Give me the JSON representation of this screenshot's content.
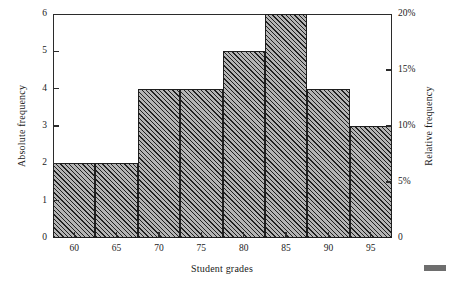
{
  "chart_data": {
    "type": "bar",
    "title": "",
    "subtitle": "",
    "xlabel": "Student grades",
    "ylabel": "Absolute frequency",
    "y2label": "Relative frequency",
    "grid": false,
    "legend": null,
    "xlim": [
      57.5,
      97.5
    ],
    "ylim": [
      0,
      6
    ],
    "y2lim": [
      0,
      20
    ],
    "bin_width": 5,
    "bin_edges": [
      57.5,
      62.5,
      67.5,
      72.5,
      77.5,
      82.5,
      87.5,
      92.5,
      97.5
    ],
    "categories": [
      "57.5-62.5",
      "62.5-67.5",
      "67.5-72.5",
      "72.5-77.5",
      "77.5-82.5",
      "82.5-87.5",
      "87.5-92.5",
      "92.5-97.5"
    ],
    "values": [
      2,
      2,
      4,
      4,
      5,
      6,
      4,
      3
    ],
    "relative_values_percent": [
      6.7,
      6.7,
      13.3,
      13.3,
      16.7,
      20.0,
      13.3,
      10.0
    ],
    "total_count": 30,
    "xticks": [
      60,
      65,
      70,
      75,
      80,
      85,
      90,
      95
    ],
    "xtick_labels": [
      "60",
      "65",
      "70",
      "75",
      "80",
      "85",
      "90",
      "95"
    ],
    "yticks": [
      0,
      1,
      2,
      3,
      4,
      5,
      6
    ],
    "ytick_labels": [
      "0",
      "1",
      "2",
      "3",
      "4",
      "5",
      "6"
    ],
    "y2ticks": [
      0,
      5,
      10,
      15,
      20
    ],
    "y2tick_labels": [
      "0",
      "5%",
      "10%",
      "15%",
      "20%"
    ],
    "bar_fill": "#b4b4b4",
    "bar_hatch": "diagonal-45",
    "bar_edge_color": "#1e1e1e",
    "frame_color": "#2b2b2b",
    "background": "#ffffff"
  },
  "figure": {
    "axis_title_x": "Student grades",
    "axis_title_y_left": "Absolute frequency",
    "axis_title_y_right": "Relative frequency"
  }
}
